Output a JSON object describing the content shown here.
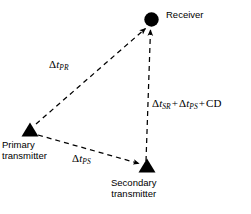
{
  "diagram": {
    "type": "network-timing-diagram",
    "background_color": "#ffffff",
    "stroke_color": "#000000",
    "nodes": [
      {
        "id": "receiver",
        "label": "Receiver",
        "marker": "filled-circle",
        "x": 151,
        "y": 19
      },
      {
        "id": "primary-transmitter",
        "label_line1": "Primary",
        "label_line2": "transmitter",
        "marker": "filled-triangle",
        "x": 30,
        "y": 131
      },
      {
        "id": "secondary-transmitter",
        "label_line1": "Secondary",
        "label_line2": "transmitter",
        "marker": "filled-triangle",
        "x": 147,
        "y": 168
      }
    ],
    "edges": [
      {
        "id": "primary-to-receiver",
        "from": "primary-transmitter",
        "to": "receiver",
        "style": "dashed",
        "arrowhead": "to",
        "label": {
          "delta": "Δ",
          "var": "t",
          "sub": "PR"
        }
      },
      {
        "id": "primary-to-secondary",
        "from": "primary-transmitter",
        "to": "secondary-transmitter",
        "style": "dashed",
        "arrowhead": "to",
        "label": {
          "delta": "Δ",
          "var": "t",
          "sub": "PS"
        }
      },
      {
        "id": "secondary-to-receiver",
        "from": "secondary-transmitter",
        "to": "receiver",
        "style": "dashed",
        "arrowhead": "to",
        "label": {
          "term1_delta": "Δ",
          "term1_var": "t",
          "term1_sub": "SR",
          "plus1": "+",
          "term2_delta": "Δ",
          "term2_var": "t",
          "term2_sub": "PS",
          "plus2": "+",
          "term3": "CD"
        }
      }
    ]
  }
}
